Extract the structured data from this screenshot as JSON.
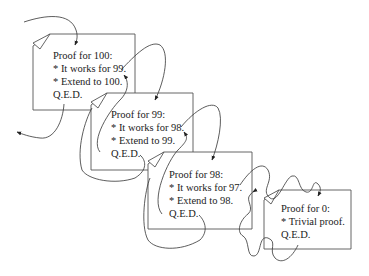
{
  "diagram": {
    "type": "recursive-proof-chain",
    "boxes": [
      {
        "id": "proof-100",
        "title": "Proof for 100:",
        "lines": [
          "* It works for 99.",
          "* Extend to 100.",
          "Q.E.D."
        ]
      },
      {
        "id": "proof-99",
        "title": "Proof for 99:",
        "lines": [
          "* It works for 98.",
          "* Extend to 99.",
          "Q.E.D."
        ]
      },
      {
        "id": "proof-98",
        "title": "Proof for 98:",
        "lines": [
          "* It works for 97.",
          "* Extend to 98.",
          "Q.E.D."
        ]
      },
      {
        "id": "proof-0",
        "title": "Proof for 0:",
        "lines": [
          "* Trivial proof.",
          "Q.E.D."
        ]
      }
    ],
    "colors": {
      "stroke": "#555555",
      "text": "#222222",
      "background": "#ffffff"
    }
  }
}
